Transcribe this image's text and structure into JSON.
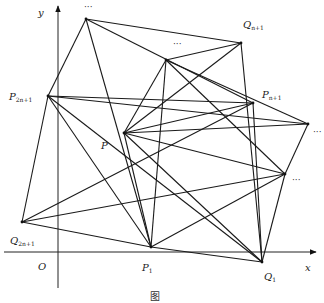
{
  "figure": {
    "axes": {
      "x_label": "x",
      "y_label": "y",
      "origin_label": "O",
      "x_axis_y": 252,
      "y_axis_x": 58
    },
    "vertices": [
      {
        "id": "top_dots",
        "label": "…",
        "x": 86,
        "y": 19
      },
      {
        "id": "Q_n1",
        "label": "Q",
        "sub": "n+1",
        "x": 241,
        "y": 43
      },
      {
        "id": "upper_dots",
        "label": "…",
        "x": 166,
        "y": 60
      },
      {
        "id": "P_n1",
        "label": "P",
        "sub": "n+1",
        "x": 253,
        "y": 103
      },
      {
        "id": "right_dots",
        "label": "…",
        "x": 308,
        "y": 124
      },
      {
        "id": "P",
        "label": "P",
        "x": 124,
        "y": 133
      },
      {
        "id": "lower_right_dots",
        "label": "…",
        "x": 285,
        "y": 174
      },
      {
        "id": "P_2n1",
        "label": "P",
        "sub": "2n+1",
        "x": 48,
        "y": 96
      },
      {
        "id": "Q_2n1",
        "label": "Q",
        "sub": "2n+1",
        "x": 22,
        "y": 222
      },
      {
        "id": "P_1",
        "label": "P",
        "sub": "1",
        "x": 151,
        "y": 247
      },
      {
        "id": "Q_1",
        "label": "Q",
        "sub": "1",
        "x": 262,
        "y": 262
      }
    ],
    "edges": [
      [
        "P_2n1",
        "top_dots"
      ],
      [
        "P_2n1",
        "right_dots"
      ],
      [
        "P_2n1",
        "P_n1"
      ],
      [
        "P_2n1",
        "P_1"
      ],
      [
        "P_2n1",
        "Q_1"
      ],
      [
        "P_2n1",
        "Q_2n1"
      ],
      [
        "top_dots",
        "Q_n1"
      ],
      [
        "top_dots",
        "P_n1"
      ],
      [
        "top_dots",
        "P_1"
      ],
      [
        "Q_n1",
        "upper_dots"
      ],
      [
        "Q_n1",
        "P"
      ],
      [
        "Q_n1",
        "Q_1"
      ],
      [
        "upper_dots",
        "P"
      ],
      [
        "upper_dots",
        "right_dots"
      ],
      [
        "upper_dots",
        "lower_right_dots"
      ],
      [
        "upper_dots",
        "P_1"
      ],
      [
        "P_n1",
        "Q_1"
      ],
      [
        "P_n1",
        "Q_2n1"
      ],
      [
        "P_n1",
        "P"
      ],
      [
        "right_dots",
        "P"
      ],
      [
        "right_dots",
        "lower_right_dots"
      ],
      [
        "P",
        "lower_right_dots"
      ],
      [
        "P",
        "Q_1"
      ],
      [
        "P",
        "P_1"
      ],
      [
        "lower_right_dots",
        "P_1"
      ],
      [
        "lower_right_dots",
        "Q_1"
      ],
      [
        "lower_right_dots",
        "Q_2n1"
      ],
      [
        "Q_2n1",
        "P_1"
      ],
      [
        "P_1",
        "Q_1"
      ]
    ],
    "labels": {
      "top_dots": "···",
      "upper_dots": "···",
      "right_dots": "···",
      "lower_right_dots": "···",
      "Q_n1_main": "Q",
      "Q_n1_sub": "n+1",
      "P_n1_main": "P",
      "P_n1_sub": "n+1",
      "P_main": "P",
      "P_2n1_main": "P",
      "P_2n1_sub": "2n+1",
      "Q_2n1_main": "Q",
      "Q_2n1_sub": "2n+1",
      "P_1_main": "P",
      "P_1_sub": "1",
      "Q_1_main": "Q",
      "Q_1_sub": "1",
      "x": "x",
      "y": "y",
      "O": "O"
    },
    "caption": "图"
  }
}
